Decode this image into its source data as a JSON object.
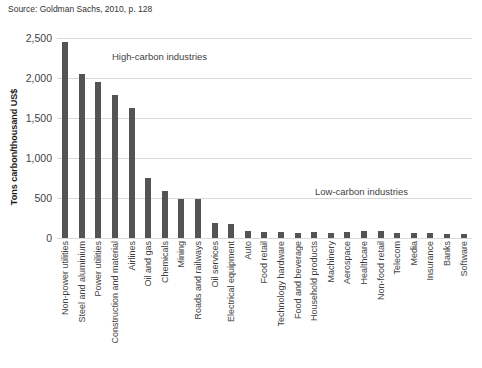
{
  "source_note": "Source: Goldman Sachs, 2010, p. 128",
  "annotations": {
    "high_carbon": "High-carbon industries",
    "low_carbon": "Low-carbon industries"
  },
  "colors": {
    "bar": "#545454",
    "gridline": "#d9d9d9",
    "text": "#3f3f3f"
  },
  "chart_data": {
    "type": "bar",
    "title": "",
    "xlabel": "",
    "ylabel": "Tons carbon/thousand US$",
    "ylim": [
      0,
      2500
    ],
    "ytick_step": 500,
    "ytick_labels": [
      "0",
      "500",
      "1,000",
      "1,500",
      "2,000",
      "2,500"
    ],
    "grid": true,
    "legend": "none",
    "categories": [
      "Non-power utilities",
      "Steel and aluminium",
      "Power utilities",
      "Construction and material",
      "Airlines",
      "Oil and gas",
      "Chemicals",
      "Mining",
      "Roads and railways",
      "Oil services",
      "Electrical equipment",
      "Auto",
      "Food retail",
      "Technology hardware",
      "Food and beverage",
      "Household products",
      "Machinery",
      "Aerospace",
      "Healthcare",
      "Non-food retail",
      "Telecom",
      "Media",
      "Insurance",
      "Banks",
      "Software"
    ],
    "values": [
      2450,
      2050,
      1950,
      1790,
      1630,
      750,
      590,
      490,
      490,
      190,
      170,
      90,
      70,
      80,
      60,
      70,
      65,
      80,
      90,
      90,
      65,
      65,
      65,
      50,
      50
    ]
  }
}
